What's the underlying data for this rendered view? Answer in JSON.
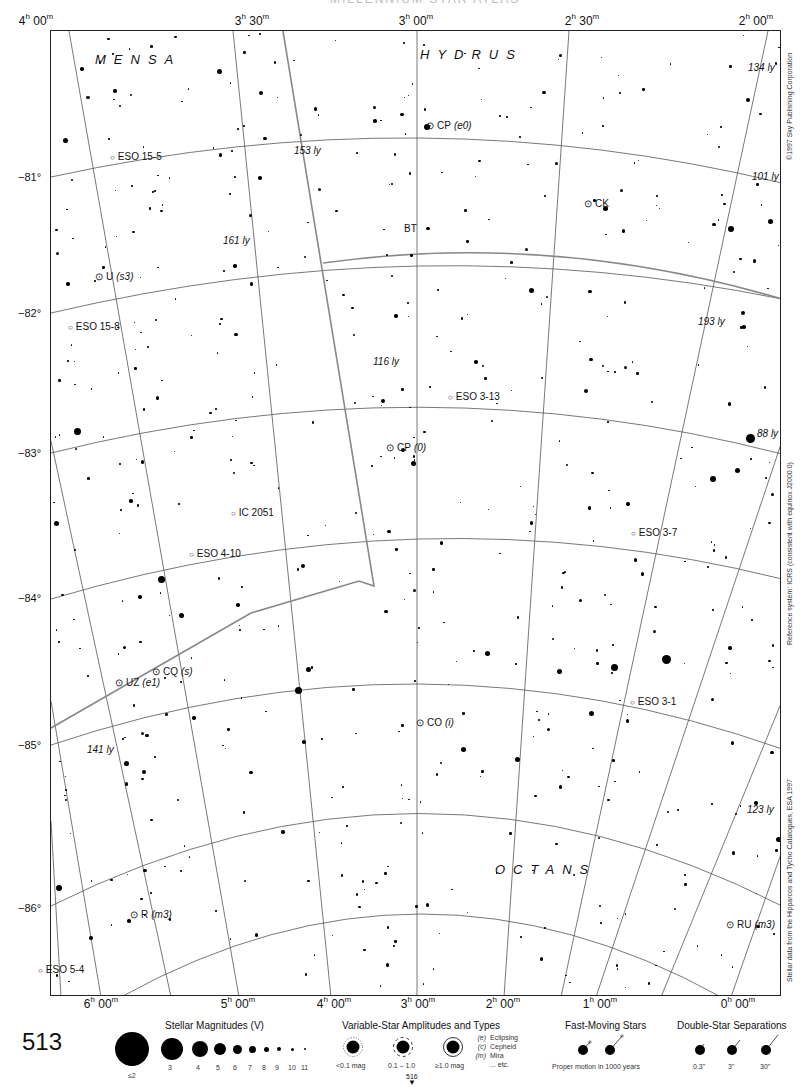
{
  "page": {
    "page_number": "513",
    "next_page_pointer": "516",
    "clipped_title": "MILLENNIUM STAR ATLAS"
  },
  "axes": {
    "ra_top": [
      {
        "h": "4",
        "m": "00",
        "x": 36
      },
      {
        "h": "3",
        "m": "30",
        "x": 252
      },
      {
        "h": "3",
        "m": "00",
        "x": 416
      },
      {
        "h": "2",
        "m": "30",
        "x": 582
      },
      {
        "h": "2",
        "m": "00",
        "x": 756
      }
    ],
    "ra_bottom": [
      {
        "h": "6",
        "m": "00",
        "x": 101
      },
      {
        "h": "5",
        "m": "00",
        "x": 238
      },
      {
        "h": "4",
        "m": "00",
        "x": 334
      },
      {
        "h": "3",
        "m": "00",
        "x": 418
      },
      {
        "h": "2",
        "m": "00",
        "x": 503
      },
      {
        "h": "1",
        "m": "00",
        "x": 600
      },
      {
        "h": "0",
        "m": "00",
        "x": 738
      }
    ],
    "dec": [
      {
        "label": "−81°",
        "y": 177
      },
      {
        "label": "−82°",
        "y": 313
      },
      {
        "label": "−83°",
        "y": 453
      },
      {
        "label": "−84°",
        "y": 598
      },
      {
        "label": "−85°",
        "y": 745
      },
      {
        "label": "−86°",
        "y": 908
      }
    ]
  },
  "constellations": [
    {
      "name": "MENSA",
      "x": 95,
      "y": 52
    },
    {
      "name": "HYDRUS",
      "x": 420,
      "y": 47
    },
    {
      "name": "OCTANS",
      "x": 495,
      "y": 862
    }
  ],
  "objects": [
    {
      "label": "CP",
      "type": "(e0)",
      "x": 426,
      "y": 126,
      "kind": "variable"
    },
    {
      "label": "ESO 15-5",
      "type": "",
      "x": 110,
      "y": 157,
      "kind": "galaxy"
    },
    {
      "label": "CK",
      "type": "",
      "x": 584,
      "y": 204,
      "kind": "variable"
    },
    {
      "label": "BT",
      "type": "",
      "x": 401,
      "y": 229,
      "kind": "star"
    },
    {
      "label": "U",
      "type": "(s3)",
      "x": 95,
      "y": 277,
      "kind": "variable"
    },
    {
      "label": "ESO 15-8",
      "type": "",
      "x": 68,
      "y": 327,
      "kind": "galaxy"
    },
    {
      "label": "ESO 3-13",
      "type": "",
      "x": 448,
      "y": 397,
      "kind": "galaxy"
    },
    {
      "label": "CP",
      "type": "(0)",
      "x": 386,
      "y": 448,
      "kind": "variable"
    },
    {
      "label": "IC 2051",
      "type": "",
      "x": 231,
      "y": 513,
      "kind": "galaxy"
    },
    {
      "label": "ESO 4-10",
      "type": "",
      "x": 189,
      "y": 554,
      "kind": "galaxy"
    },
    {
      "label": "ESO 3-7",
      "type": "",
      "x": 631,
      "y": 533,
      "kind": "galaxy"
    },
    {
      "label": "CQ",
      "type": "(s)",
      "x": 152,
      "y": 672,
      "kind": "variable"
    },
    {
      "label": "UZ",
      "type": "(e1)",
      "x": 115,
      "y": 683,
      "kind": "variable"
    },
    {
      "label": "CO",
      "type": "(i)",
      "x": 416,
      "y": 723,
      "kind": "variable"
    },
    {
      "label": "ESO 3-1",
      "type": "",
      "x": 630,
      "y": 702,
      "kind": "galaxy"
    },
    {
      "label": "R",
      "type": "(m3)",
      "x": 130,
      "y": 915,
      "kind": "variable"
    },
    {
      "label": "RU",
      "type": "(m3)",
      "x": 726,
      "y": 925,
      "kind": "variable"
    },
    {
      "label": "ESO 5-4",
      "type": "",
      "x": 38,
      "y": 970,
      "kind": "galaxy"
    }
  ],
  "distances": [
    {
      "label": "134 ly",
      "x": 748,
      "y": 68
    },
    {
      "label": "153 ly",
      "x": 294,
      "y": 151
    },
    {
      "label": "101 ly",
      "x": 752,
      "y": 177
    },
    {
      "label": "161 ly",
      "x": 223,
      "y": 241
    },
    {
      "label": "193 ly",
      "x": 698,
      "y": 322
    },
    {
      "label": "116 ly",
      "x": 373,
      "y": 362
    },
    {
      "label": "88 ly",
      "x": 757,
      "y": 434
    },
    {
      "label": "141 ly",
      "x": 87,
      "y": 750
    },
    {
      "label": "123 ly",
      "x": 747,
      "y": 810
    }
  ],
  "side_notes": {
    "copyright": "©1997 Sky Publishing Corporation",
    "reference": "Reference system: ICRS (consistent with equinox J2000.0)",
    "source": "Stellar data from the Hipparcos and Tycho Catalogues, ESA 1997"
  },
  "legend": {
    "magnitudes": {
      "title": "Stellar Magnitudes (V)",
      "items": [
        {
          "label": "≤2",
          "size": 34
        },
        {
          "label": "3",
          "size": 22
        },
        {
          "label": "4",
          "size": 16
        },
        {
          "label": "5",
          "size": 12
        },
        {
          "label": "6",
          "size": 9
        },
        {
          "label": "7",
          "size": 7
        },
        {
          "label": "8",
          "size": 5
        },
        {
          "label": "9",
          "size": 4
        },
        {
          "label": "10",
          "size": 3
        },
        {
          "label": "11",
          "size": 2
        }
      ]
    },
    "variables": {
      "title": "Variable-Star Amplitudes and Types",
      "amplitudes": [
        "<0.1 mag",
        "0.1 – 1.0",
        "≥1.0 mag"
      ],
      "types": [
        {
          "code": "(e)",
          "name": "Eclipsing"
        },
        {
          "code": "(c)",
          "name": "Cepheid"
        },
        {
          "code": "(m)",
          "name": "Mira"
        },
        {
          "code": "",
          "name": "... etc."
        }
      ]
    },
    "fast_moving": {
      "title": "Fast-Moving Stars",
      "caption": "Proper motion in 1000 years"
    },
    "double_stars": {
      "title": "Double-Star Separations",
      "items": [
        "0.3\"",
        "3\"",
        "30\""
      ]
    }
  }
}
